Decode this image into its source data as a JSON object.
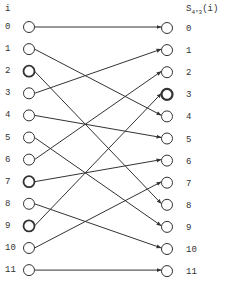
{
  "diagram": {
    "left_header": "i",
    "right_header": {
      "base": "S",
      "subscript": "4*3",
      "suffix": "(i)"
    },
    "left_labels": [
      "0",
      "1",
      "2",
      "3",
      "4",
      "5",
      "6",
      "7",
      "8",
      "9",
      "10",
      "11"
    ],
    "right_labels": [
      "0",
      "1",
      "2",
      "3",
      "4",
      "5",
      "6",
      "7",
      "8",
      "9",
      "10",
      "11"
    ],
    "permutation": [
      0,
      4,
      8,
      1,
      5,
      9,
      2,
      6,
      10,
      3,
      7,
      11
    ],
    "permutation_rule": "i -> (i mod 3)*4 + floor(i/3)",
    "bold_nodes": {
      "left": [
        2,
        7,
        9
      ],
      "right": [
        3
      ]
    },
    "line_color": "#333333",
    "node_stroke": "#333333"
  }
}
